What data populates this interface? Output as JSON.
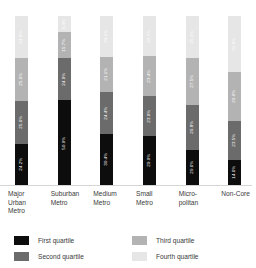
{
  "chart_data": {
    "type": "bar",
    "subtype": "stacked-100-percent",
    "title": "",
    "subtitle": "",
    "xlabel": "",
    "ylabel": "",
    "ylim": [
      0,
      100
    ],
    "grid": false,
    "legend_position": "bottom",
    "value_suffix": "%",
    "categories": [
      "Major Urban Metro",
      "Suburban Metro",
      "Medium Metro",
      "Small Metro",
      "Micropolitan",
      "Non-Core"
    ],
    "category_lines": [
      [
        "Major",
        "Urban",
        "Metro"
      ],
      [
        "Suburban",
        "Metro"
      ],
      [
        "Medium",
        "Metro"
      ],
      [
        "Small",
        "Metro"
      ],
      [
        "Micro-",
        "politan"
      ],
      [
        "Non-Core"
      ]
    ],
    "series": [
      {
        "name": "First quartile",
        "color": "#0d0d0d",
        "label_color": "#ffffff",
        "values": [
          24.2,
          50.0,
          30.4,
          29.0,
          20.6,
          14.6
        ],
        "labels": [
          "24.2%",
          "50.0%",
          "30.4%",
          "29.0%",
          "20.6%",
          "14.6%"
        ]
      },
      {
        "name": "Second quartile",
        "color": "#6b6b6b",
        "label_color": "#ffffff",
        "values": [
          25.6,
          24.9,
          24.4,
          23.9,
          26.8,
          23.5
        ],
        "labels": [
          "25.6%",
          "24.9%",
          "24.4%",
          "23.9%",
          "26.8%",
          "23.5%"
        ]
      },
      {
        "name": "Third quartile",
        "color": "#b3b3b3",
        "label_color": "#ffffff",
        "values": [
          25.6,
          15.7,
          21.1,
          23.4,
          27.5,
          29.0
        ],
        "labels": [
          "25.6%",
          "15.7%",
          "21.1%",
          "23.4%",
          "27.5%",
          "29.0%"
        ]
      },
      {
        "name": "Fourth quartile",
        "color": "#e6e6e6",
        "label_color": "#ffffff",
        "values": [
          24.6,
          9.4,
          24.1,
          23.7,
          25.1,
          32.9
        ],
        "labels": [
          "24.6%",
          "9.4%",
          "24.1%",
          "23.7%",
          "25.1%",
          "32.9%"
        ]
      }
    ]
  },
  "legend": {
    "items": [
      {
        "label": "First quartile",
        "color": "#0d0d0d"
      },
      {
        "label": "Third quartile",
        "color": "#b3b3b3"
      },
      {
        "label": "Second quartile",
        "color": "#6b6b6b"
      },
      {
        "label": "Fourth quartile",
        "color": "#e6e6e6"
      }
    ]
  },
  "colors": {
    "axis_line": "#d5d5d5",
    "text": "#3a3a3a",
    "background": "#ffffff"
  }
}
